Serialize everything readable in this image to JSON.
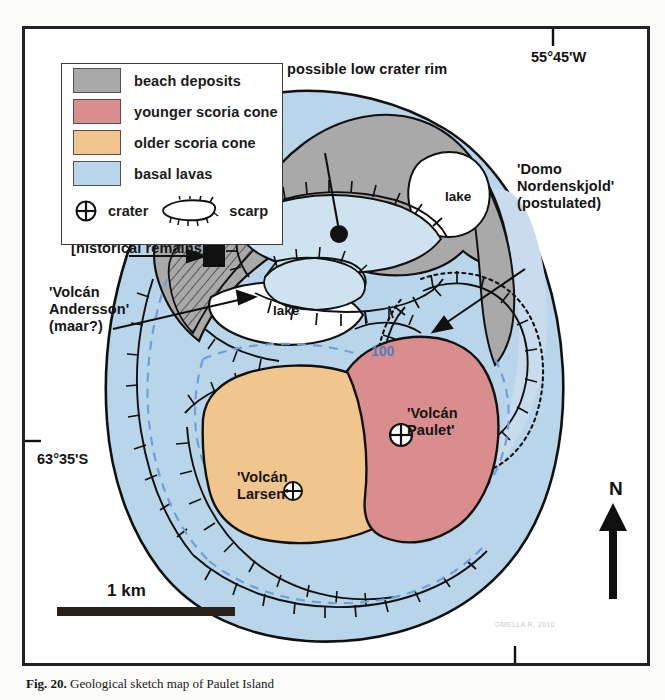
{
  "figure": {
    "caption_bold": "Fig. 20.",
    "caption_rest": "Geological sketch map of Paulet Island"
  },
  "legend": {
    "items": [
      {
        "label": "beach deposits",
        "color": "#a9a9a9"
      },
      {
        "label": "younger scoria cone",
        "color": "#d98d8d"
      },
      {
        "label": "older scoria cone",
        "color": "#f0c68e"
      },
      {
        "label": "basal lavas",
        "color": "#b9d5e9"
      }
    ],
    "symbols": [
      {
        "name": "crater-symbol",
        "label": "crater"
      },
      {
        "name": "scarp-symbol",
        "label": "scarp"
      }
    ]
  },
  "annotations": {
    "crater_rim": "possible low crater rim",
    "age": "0.3±0.1",
    "larsens_hut": "Larsen's hut\n[historical remains]",
    "volcan_andersson": "'Volcán\nAndersson'\n(maar?)",
    "domo": "'Domo\nNordenskjold'\n(postulated)",
    "volcan_paulet": "'Volcán\nPaulet'",
    "volcan_larsen": "'Volcán\nLarsen'",
    "lake_north": "lake",
    "lake_west": "lake",
    "contour_100": "100"
  },
  "graticule": {
    "longitude": "55°45'W",
    "latitude": "63°35'S"
  },
  "scale": {
    "label": "1 km"
  },
  "north": {
    "label": "N"
  },
  "colors": {
    "beach": "#a9a9a9",
    "younger": "#d98d8d",
    "older": "#f0c68e",
    "basal": "#b9d5e9",
    "basal_shade": "#c9dced",
    "contour": "#6f9fd8",
    "ink": "#141414",
    "frame": "#222222"
  },
  "bleed_text": "OMELLA R, 2010"
}
